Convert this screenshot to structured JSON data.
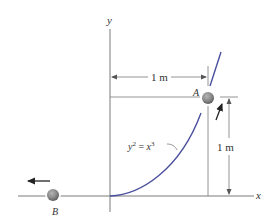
{
  "axes": {
    "x_label": "x",
    "y_label": "y"
  },
  "curve": {
    "equation_lhs": "y",
    "equation_lhs_exp": "2",
    "equation_eq": " = ",
    "equation_rhs": "x",
    "equation_rhs_exp": "3"
  },
  "points": {
    "a_label": "A",
    "b_label": "B"
  },
  "dimensions": {
    "horizontal": "1 m",
    "vertical": "1 m"
  },
  "colors": {
    "curve": "#4a4f9e",
    "line": "#6f6f6f",
    "ball": "#8a8a8a",
    "arrow": "#222222"
  }
}
